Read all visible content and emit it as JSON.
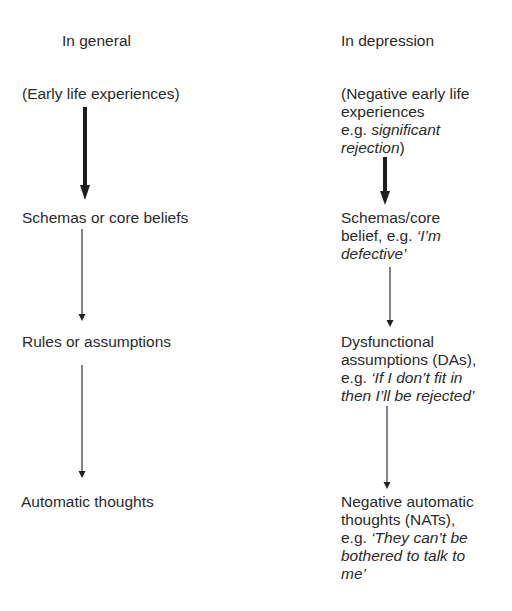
{
  "headers": {
    "left": "In general",
    "right": "In depression"
  },
  "left_column": [
    {
      "label": "(Early life experiences)"
    },
    {
      "label": "Schemas or core beliefs"
    },
    {
      "label": "Rules or assumptions"
    },
    {
      "label": "Automatic thoughts"
    }
  ],
  "right_column": [
    {
      "lines": [
        "(Negative early life",
        "experiences"
      ],
      "eg_prefix": "e.g. ",
      "eg_italic_1": "significant",
      "eg_italic_2": "rejection",
      "eg_suffix": ")"
    },
    {
      "line1": "Schemas/core",
      "line2_plain": "belief, e.g. ",
      "line2_italic": "‘I’m",
      "line3_italic": "defective’"
    },
    {
      "line1": "Dysfunctional",
      "line2": "assumptions (DAs),",
      "line3_plain": "e.g. ",
      "line3_italic": "‘If I don’t fit in",
      "line4_italic": "then I’ll be rejected’"
    },
    {
      "line1": "Negative automatic",
      "line2": "thoughts (NATs),",
      "line3_plain": "e.g. ",
      "line3_italic": "‘They can’t be",
      "line4_italic": "bothered to talk to",
      "line5_italic": "me’"
    }
  ],
  "colors": {
    "text": "#2a2a2a",
    "arrow": "#1e1e1e",
    "background": "#ffffff"
  }
}
